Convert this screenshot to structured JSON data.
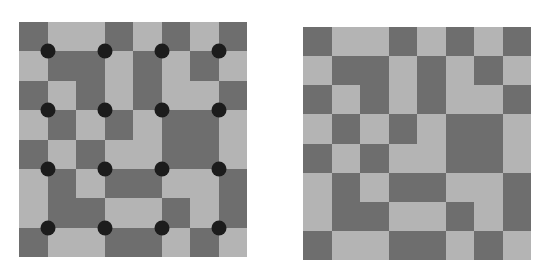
{
  "colors": {
    "dark": "#6e6e6e",
    "light": "#b4b4b4",
    "dot": "#1c1c1c",
    "background": "#ffffff"
  },
  "grid_size": 8,
  "pattern": [
    "DLLDLDLD",
    "LDDLDLDL",
    "DLDLDLLD",
    "LDLDLDDL",
    "DLDLLDDL",
    "LDLDDLLD",
    "LDDLLDLD",
    "DLLDDLDL"
  ],
  "dots": {
    "rows": [
      1,
      3,
      5,
      7
    ],
    "cols": [
      1,
      3,
      5,
      7
    ]
  },
  "panels": [
    {
      "id": "left",
      "has_dots": true
    },
    {
      "id": "right",
      "has_dots": false
    }
  ]
}
